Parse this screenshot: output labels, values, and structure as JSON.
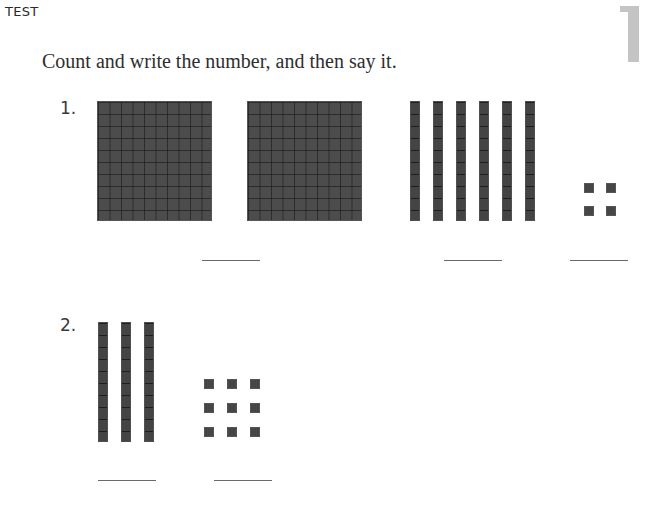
{
  "header": {
    "label": "TEST",
    "page_number": "1"
  },
  "instructions": "Count and write the number, and then say it.",
  "problems": [
    {
      "number": "1.",
      "hundreds": 2,
      "tens": 6,
      "ones": 4,
      "answer_blanks": 3
    },
    {
      "number": "2.",
      "hundreds": 0,
      "tens": 3,
      "ones": 9,
      "answer_blanks": 2
    }
  ],
  "colors": {
    "block_fill": "#4a4a4a",
    "page_number_gray": "#c4c4c4",
    "text": "#2e2e2e"
  }
}
